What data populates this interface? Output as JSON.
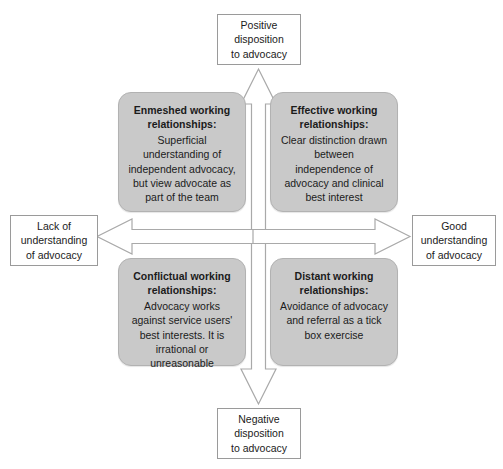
{
  "diagram": {
    "axes": {
      "vertical_positive": "Positive\ndisposition\nto advocacy",
      "vertical_negative": "Negative\ndisposition\nto advocacy",
      "horizontal_negative": "Lack of\nunderstanding\nof advocacy",
      "horizontal_positive": "Good\nunderstanding\nof advocacy"
    },
    "axis_labels": {
      "top": {
        "line1": "Positive",
        "line2": "disposition",
        "line3": "to advocacy"
      },
      "bottom": {
        "line1": "Negative",
        "line2": "disposition",
        "line3": "to advocacy"
      },
      "left": {
        "line1": "Lack of",
        "line2": "understanding",
        "line3": "of advocacy"
      },
      "right": {
        "line1": "Good",
        "line2": "understanding",
        "line3": "of advocacy"
      }
    },
    "quadrants": {
      "top_left": {
        "title": "Enmeshed working relationships:",
        "body": "Superficial understanding of independent advocacy, but view advocate as part of the team"
      },
      "top_right": {
        "title": "Effective working relationships:",
        "body": "Clear distinction drawn between independence of advocacy and clinical best interest"
      },
      "bottom_left": {
        "title": "Conflictual working relationships:",
        "body": "Advocacy works against service users' best interests. It is irrational or unreasonable"
      },
      "bottom_right": {
        "title": "Distant working relationships:",
        "body": "Avoidance of advocacy and referral as a tick box exercise"
      }
    },
    "colors": {
      "quadrant_fill": "#c9c9c9",
      "quadrant_border": "#b2b2b2",
      "label_border": "#9a9a9a",
      "arrow_stroke": "#a9a9a9",
      "arrow_fill": "#ffffff",
      "text": "#1b1b1b",
      "background": "#ffffff"
    }
  }
}
